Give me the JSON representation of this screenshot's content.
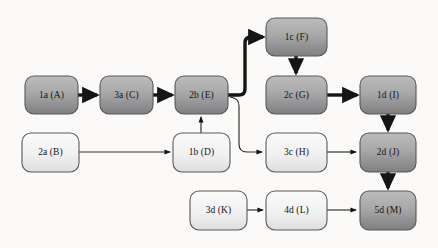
{
  "diagram": {
    "background_color": "#fbfaf8",
    "palette": {
      "dark_node_top": "#b4b4b4",
      "dark_node_bottom": "#848486",
      "light_node_top": "#f6f6f6",
      "light_node_bottom": "#e4e4e4",
      "node_border": "#58585a",
      "edge_color": "#1a1a1a",
      "label_color": "#141414"
    },
    "nodes": [
      {
        "id": "A",
        "label": "1a (A)",
        "shade": "dark",
        "x": 25,
        "y": 76,
        "w": 53,
        "h": 38
      },
      {
        "id": "C",
        "label": "3a (C)",
        "shade": "dark",
        "x": 100,
        "y": 76,
        "w": 53,
        "h": 38
      },
      {
        "id": "E",
        "label": "2b (E)",
        "shade": "dark",
        "x": 175,
        "y": 76,
        "w": 53,
        "h": 38
      },
      {
        "id": "F",
        "label": "1c (F)",
        "shade": "dark",
        "x": 266,
        "y": 18,
        "w": 61,
        "h": 38
      },
      {
        "id": "G",
        "label": "2c (G)",
        "shade": "dark",
        "x": 266,
        "y": 76,
        "w": 61,
        "h": 38
      },
      {
        "id": "I",
        "label": "1d (I)",
        "shade": "dark",
        "x": 360,
        "y": 76,
        "w": 56,
        "h": 38
      },
      {
        "id": "B",
        "label": "2a (B)",
        "shade": "light",
        "x": 22,
        "y": 133,
        "w": 57,
        "h": 39
      },
      {
        "id": "D",
        "label": "1b (D)",
        "shade": "light",
        "x": 173,
        "y": 133,
        "w": 57,
        "h": 39
      },
      {
        "id": "H",
        "label": "3c (H)",
        "shade": "light",
        "x": 266,
        "y": 133,
        "w": 61,
        "h": 39
      },
      {
        "id": "J",
        "label": "2d (J)",
        "shade": "dark",
        "x": 360,
        "y": 133,
        "w": 56,
        "h": 39
      },
      {
        "id": "K",
        "label": "3d (K)",
        "shade": "light",
        "x": 190,
        "y": 191,
        "w": 57,
        "h": 39
      },
      {
        "id": "L",
        "label": "4d (L)",
        "shade": "light",
        "x": 266,
        "y": 191,
        "w": 61,
        "h": 39
      },
      {
        "id": "M",
        "label": "5d (M)",
        "shade": "dark",
        "x": 360,
        "y": 191,
        "w": 56,
        "h": 39
      }
    ],
    "edges": [
      {
        "from": "A",
        "to": "C",
        "weight": "thick",
        "kind": "straight"
      },
      {
        "from": "C",
        "to": "E",
        "weight": "thick",
        "kind": "straight"
      },
      {
        "from": "E",
        "to": "F",
        "weight": "thick",
        "kind": "curved-up"
      },
      {
        "from": "F",
        "to": "G",
        "weight": "thick",
        "kind": "straight-down"
      },
      {
        "from": "G",
        "to": "I",
        "weight": "thick",
        "kind": "straight"
      },
      {
        "from": "I",
        "to": "J",
        "weight": "thick",
        "kind": "straight-down"
      },
      {
        "from": "J",
        "to": "M",
        "weight": "thick",
        "kind": "straight-down"
      },
      {
        "from": "B",
        "to": "D",
        "weight": "thin",
        "kind": "straight"
      },
      {
        "from": "D",
        "to": "E",
        "weight": "thin",
        "kind": "straight-up"
      },
      {
        "from": "E",
        "to": "H",
        "weight": "thin",
        "kind": "curved-down"
      },
      {
        "from": "H",
        "to": "J",
        "weight": "thin",
        "kind": "straight"
      },
      {
        "from": "K",
        "to": "L",
        "weight": "thin",
        "kind": "straight"
      },
      {
        "from": "L",
        "to": "M",
        "weight": "thin",
        "kind": "straight"
      }
    ]
  }
}
